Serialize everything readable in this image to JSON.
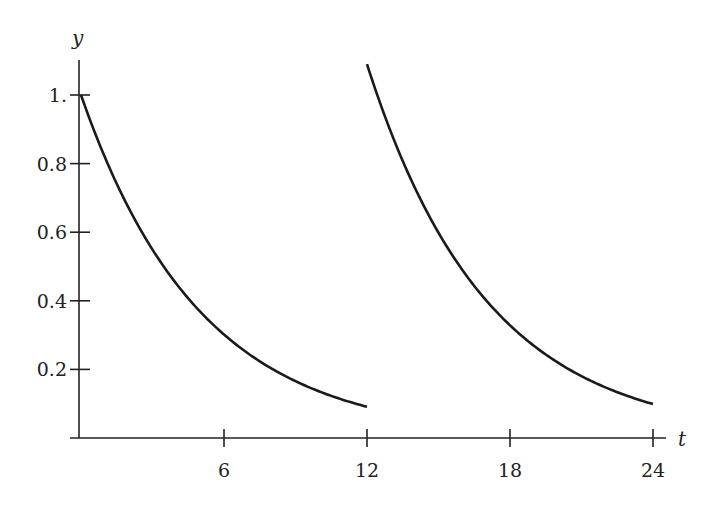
{
  "chart_data": {
    "type": "line",
    "title": "",
    "xlabel": "t",
    "ylabel": "y",
    "xlim": [
      0,
      24
    ],
    "ylim": [
      0,
      1.1
    ],
    "x_ticks": [
      6,
      12,
      18,
      24
    ],
    "x_tick_labels": [
      "6",
      "12",
      "18",
      "24"
    ],
    "y_ticks": [
      0.2,
      0.4,
      0.6,
      0.8,
      1.0
    ],
    "y_tick_labels": [
      "0.2",
      "0.4",
      "0.6",
      "0.8",
      "1."
    ],
    "grid": false,
    "legend": null,
    "series": [
      {
        "name": "segment-1",
        "description": "exponential decay y = e^(-0.2 t), 0 <= t <= 12",
        "x": [
          0,
          2,
          4,
          6,
          8,
          10,
          12
        ],
        "y": [
          1.0,
          0.67,
          0.449,
          0.301,
          0.202,
          0.135,
          0.091
        ]
      },
      {
        "name": "segment-2",
        "description": "exponential decay after second dose y = 1.09 e^(-0.2 (t-12)), 12 <= t <= 24",
        "x": [
          12,
          14,
          16,
          18,
          20,
          22,
          24
        ],
        "y": [
          1.09,
          0.731,
          0.49,
          0.328,
          0.22,
          0.147,
          0.099
        ]
      }
    ]
  }
}
